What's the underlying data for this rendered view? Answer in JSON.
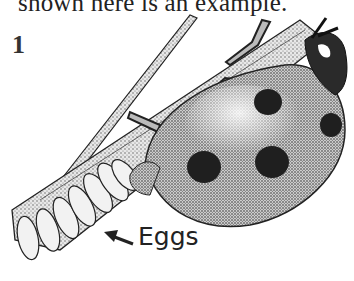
{
  "document": {
    "caption_text": "shown here is an example.",
    "figure_number": "1",
    "labels": {
      "eggs": "Eggs"
    },
    "illustration": {
      "subject": "ladybug laying eggs on a plant stem",
      "style": "black-and-white stipple drawing",
      "spot_count": 5
    }
  }
}
